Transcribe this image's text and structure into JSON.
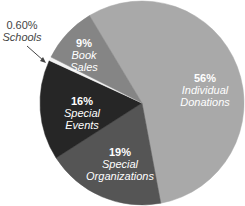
{
  "chart_data": {
    "type": "pie",
    "title": "",
    "categories": [
      "Individual Donations",
      "Special Organizations",
      "Special Events",
      "Schools",
      "Book Sales"
    ],
    "values": [
      56,
      19,
      16,
      0.6,
      9
    ],
    "labels": [
      "56%",
      "19%",
      "16%",
      "0.60%",
      "9%"
    ],
    "colors": [
      "#a9a9a9",
      "#555555",
      "#262626",
      "#f2f2f2",
      "#858585"
    ],
    "start_angle_deg": 329,
    "direction": "clockwise",
    "legend": "none",
    "annotations": [
      {
        "text": "0.60% Schools",
        "type": "arrow-callout",
        "target": "Schools"
      }
    ]
  },
  "labels": {
    "donations": {
      "pct": "56%",
      "name1": "Individual",
      "name2": "Donations"
    },
    "organizations": {
      "pct": "19%",
      "name1": "Special",
      "name2": "Organizations"
    },
    "events": {
      "pct": "16%",
      "name1": "Special",
      "name2": "Events"
    },
    "schools": {
      "pct": "0.60%",
      "name1": "Schools"
    },
    "books": {
      "pct": "9%",
      "name1": "Book",
      "name2": "Sales"
    }
  }
}
